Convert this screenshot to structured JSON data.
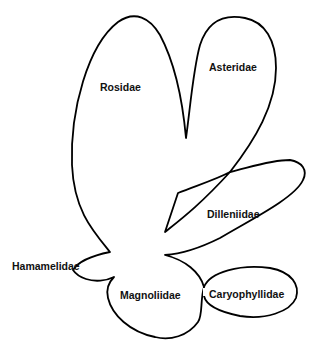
{
  "diagram": {
    "type": "subclass-relationship-outline",
    "stroke_color": "#000000",
    "background": "#ffffff",
    "labels": {
      "rosidae": "Rosidae",
      "asteridae": "Asteridae",
      "dilleniidae": "Dilleniidae",
      "hamamelidae": "Hamamelidae",
      "magnoliidae": "Magnoliidae",
      "caryophyllidae": "Caryophyllidae"
    }
  }
}
